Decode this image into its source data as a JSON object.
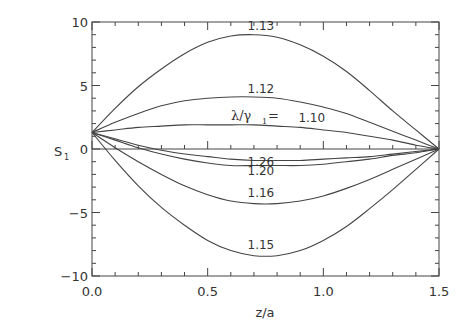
{
  "chart_data": {
    "type": "line",
    "title": "",
    "xlabel": "z/a",
    "ylabel": "S1",
    "xlim": [
      0.0,
      1.5
    ],
    "ylim": [
      -10,
      10
    ],
    "x_ticks": [
      "0.0",
      "0.5",
      "1.0",
      "1.5"
    ],
    "y_ticks": [
      "10",
      "5",
      "0",
      "-5",
      "-10"
    ],
    "grid": false,
    "legend": "inline labels",
    "annotation": "λ/γ1=",
    "x": [
      0.0,
      0.1,
      0.2,
      0.3,
      0.4,
      0.5,
      0.6,
      0.7,
      0.8,
      0.9,
      1.0,
      1.1,
      1.2,
      1.3,
      1.4,
      1.5
    ],
    "series": [
      {
        "name": "1.13",
        "values": [
          1.3,
          3.2,
          4.9,
          6.3,
          7.5,
          8.4,
          8.9,
          9.0,
          8.8,
          8.2,
          7.3,
          6.1,
          4.6,
          3.0,
          1.5,
          0.0
        ]
      },
      {
        "name": "1.12",
        "values": [
          1.3,
          2.1,
          2.8,
          3.4,
          3.8,
          4.0,
          4.1,
          4.1,
          4.0,
          3.7,
          3.3,
          2.8,
          2.1,
          1.4,
          0.7,
          0.0
        ]
      },
      {
        "name": "1.10",
        "values": [
          1.3,
          1.5,
          1.7,
          1.8,
          1.9,
          1.9,
          1.9,
          1.9,
          1.8,
          1.7,
          1.5,
          1.3,
          1.0,
          0.7,
          0.3,
          0.0
        ]
      },
      {
        "name": "1.26",
        "values": [
          1.3,
          0.8,
          0.3,
          -0.1,
          -0.4,
          -0.6,
          -0.8,
          -0.9,
          -0.9,
          -0.9,
          -0.8,
          -0.7,
          -0.6,
          -0.4,
          -0.2,
          0.0
        ]
      },
      {
        "name": "1.20",
        "values": [
          1.3,
          0.7,
          0.1,
          -0.4,
          -0.8,
          -1.1,
          -1.3,
          -1.3,
          -1.3,
          -1.3,
          -1.2,
          -1.0,
          -0.8,
          -0.5,
          -0.3,
          0.0
        ]
      },
      {
        "name": "1.16",
        "values": [
          1.3,
          0.1,
          -1.0,
          -2.0,
          -2.9,
          -3.6,
          -4.1,
          -4.3,
          -4.3,
          -4.1,
          -3.7,
          -3.1,
          -2.4,
          -1.6,
          -0.8,
          0.0
        ]
      },
      {
        "name": "1.15",
        "values": [
          1.3,
          -0.9,
          -2.9,
          -4.6,
          -6.0,
          -7.2,
          -8.0,
          -8.4,
          -8.4,
          -8.0,
          -7.2,
          -6.1,
          -4.7,
          -3.2,
          -1.6,
          0.0
        ]
      }
    ],
    "label_positions": [
      {
        "name": "1.13",
        "x": 0.73,
        "y": 9.35
      },
      {
        "name": "1.12",
        "x": 0.73,
        "y": 4.4
      },
      {
        "name": "1.10",
        "x": 0.95,
        "y": 2.1
      },
      {
        "name": "1.26",
        "x": 0.73,
        "y": -1.35
      },
      {
        "name": "1.20",
        "x": 0.73,
        "y": -2.05
      },
      {
        "name": "1.16",
        "x": 0.73,
        "y": -3.8
      },
      {
        "name": "1.15",
        "x": 0.73,
        "y": -7.9
      }
    ]
  },
  "labels": {
    "xlabel": "z/a",
    "ylabel_main": "S",
    "ylabel_sub": "1",
    "annotation": "λ/γ",
    "annotation_sub": "1",
    "annotation_eq": "="
  },
  "colors": {
    "line": "#444444",
    "axis": "#444444",
    "text": "#333333",
    "background": "#ffffff"
  }
}
